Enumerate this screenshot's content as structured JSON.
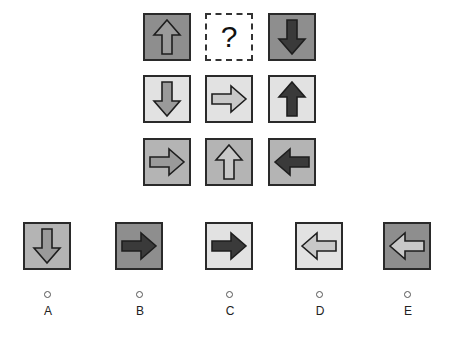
{
  "puzzle": {
    "question_mark": "?",
    "colors": {
      "light": "#e2e2e2",
      "medium": "#b4b4b4",
      "dark": "#8e8e8e",
      "arrow_dark": "#3a3a3a",
      "arrow_medium": "#9a9a9a",
      "arrow_light": "#c8c8c8"
    },
    "grid": [
      [
        {
          "direction": "up",
          "bg": "dark",
          "fill": "medium"
        },
        {
          "missing": true
        },
        {
          "direction": "down",
          "bg": "dark",
          "fill": "dark"
        }
      ],
      [
        {
          "direction": "down",
          "bg": "light",
          "fill": "medium"
        },
        {
          "direction": "right",
          "bg": "light",
          "fill": "light"
        },
        {
          "direction": "up",
          "bg": "light",
          "fill": "dark"
        }
      ],
      [
        {
          "direction": "right",
          "bg": "medium",
          "fill": "medium"
        },
        {
          "direction": "up",
          "bg": "medium",
          "fill": "light"
        },
        {
          "direction": "left",
          "bg": "medium",
          "fill": "dark"
        }
      ]
    ]
  },
  "options": [
    {
      "label": "A",
      "direction": "down",
      "bg": "medium",
      "fill": "medium"
    },
    {
      "label": "B",
      "direction": "right",
      "bg": "dark",
      "fill": "dark"
    },
    {
      "label": "C",
      "direction": "right",
      "bg": "light",
      "fill": "dark"
    },
    {
      "label": "D",
      "direction": "left",
      "bg": "light",
      "fill": "light"
    },
    {
      "label": "E",
      "direction": "left",
      "bg": "dark",
      "fill": "light"
    }
  ]
}
